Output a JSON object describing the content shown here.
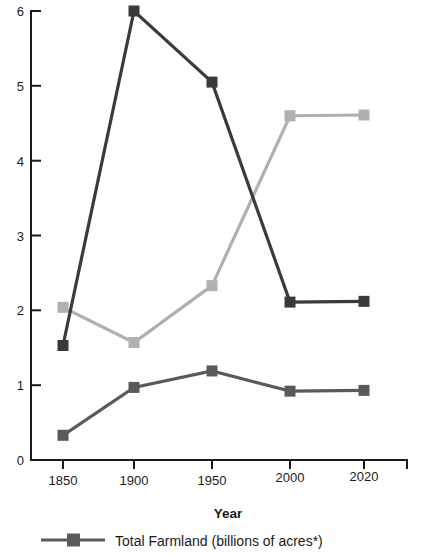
{
  "chart_data": {
    "type": "line",
    "title": "",
    "subtitle": "",
    "xlabel": "Year",
    "ylabel": "",
    "categories": [
      "1850",
      "1900",
      "1950",
      "2000",
      "2020"
    ],
    "x": [
      1850,
      1900,
      1950,
      2000,
      2020
    ],
    "xlim": [
      1835,
      2035
    ],
    "ylim": [
      0,
      6
    ],
    "yticks": [
      0,
      1,
      2,
      3,
      4,
      5,
      6
    ],
    "ytick_labels": [
      "0",
      "1",
      "2",
      "3",
      "4",
      "5",
      "6"
    ],
    "xtick_labels": [
      "1850",
      "1900",
      "1950",
      "2000",
      "2020"
    ],
    "grid": false,
    "legend_position": "bottom",
    "series": [
      {
        "name": "dark-series",
        "label": "",
        "color": "#3a3a3a",
        "marker": "square",
        "values": [
          1.53,
          6.0,
          5.05,
          2.11,
          2.12
        ]
      },
      {
        "name": "light-series",
        "label": "",
        "color": "#b0b0b0",
        "marker": "square",
        "values": [
          2.04,
          1.57,
          2.33,
          4.6,
          4.61
        ]
      },
      {
        "name": "total-farmland",
        "label": "Total Farmland (billions of acres*)",
        "color": "#5a5a5a",
        "marker": "square",
        "values": [
          0.33,
          0.97,
          1.19,
          0.92,
          0.93
        ]
      }
    ],
    "legend": [
      {
        "label": "Total Farmland (billions of acres*)",
        "color": "#5a5a5a",
        "marker": "square"
      }
    ]
  },
  "axes": {
    "x_title": "Year",
    "y_title": ""
  },
  "colors": {
    "axis": "#1a1a1a",
    "text": "#1a1a1a",
    "background": "#ffffff",
    "series_dark": "#3a3a3a",
    "series_light": "#b0b0b0",
    "series_medium": "#5a5a5a"
  }
}
